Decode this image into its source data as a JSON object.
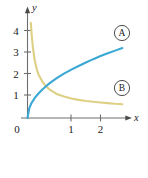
{
  "figure": {
    "background_color": "#ffffff",
    "axis_color": "#6e6e6e",
    "text_color": "#1a1a1a"
  },
  "axes": {
    "x_axis_label": "x",
    "y_axis_label": "y",
    "origin_label": "0",
    "x_ticks": [
      {
        "label": "1",
        "value": 1
      },
      {
        "label": "2",
        "value": 2
      }
    ],
    "y_ticks": [
      {
        "label": "1",
        "value": 1
      },
      {
        "label": "2",
        "value": 2
      },
      {
        "label": "3",
        "value": 3
      },
      {
        "label": "4",
        "value": 4
      }
    ]
  },
  "labels": {
    "curve_a_badge": "A",
    "curve_b_badge": "B"
  },
  "chart_data": {
    "type": "line",
    "title": "",
    "xlabel": "x",
    "ylabel": "y",
    "xlim": [
      0,
      2.75
    ],
    "ylim": [
      0,
      4.6
    ],
    "grid": false,
    "legend": "circled-badges-at-curve-ends",
    "xticks": [
      0,
      1,
      2
    ],
    "xticklabels": [
      "0",
      "1",
      "2"
    ],
    "yticks": [
      1,
      2,
      3,
      4
    ],
    "yticklabels": [
      "1",
      "2",
      "3",
      "4"
    ],
    "series": [
      {
        "name": "A",
        "color": "#3ba8d4",
        "description": "increasing concave-down curve through origin, rising to about 3.3 at x=2.6",
        "x": [
          0.0,
          0.05,
          0.1,
          0.2,
          0.3,
          0.4,
          0.5,
          0.6,
          0.8,
          1.0,
          1.2,
          1.4,
          1.6,
          1.8,
          2.0,
          2.2,
          2.4,
          2.6
        ],
        "y": [
          0.0,
          0.45,
          0.65,
          0.92,
          1.12,
          1.29,
          1.44,
          1.58,
          1.82,
          2.03,
          2.21,
          2.38,
          2.54,
          2.69,
          2.83,
          2.96,
          3.08,
          3.2
        ]
      },
      {
        "name": "B",
        "color": "#ddd084",
        "description": "decreasing convex curve, asymptotic to x-axis, descending from about 4.3 near x=0.1 to 0.6 at x=2.6",
        "x": [
          0.09,
          0.12,
          0.15,
          0.2,
          0.25,
          0.3,
          0.4,
          0.5,
          0.6,
          0.8,
          1.0,
          1.2,
          1.4,
          1.6,
          1.8,
          2.0,
          2.2,
          2.4,
          2.6
        ],
        "y": [
          4.35,
          3.7,
          3.2,
          2.62,
          2.25,
          2.0,
          1.68,
          1.46,
          1.31,
          1.1,
          0.98,
          0.89,
          0.83,
          0.78,
          0.74,
          0.71,
          0.68,
          0.65,
          0.63
        ]
      }
    ],
    "intersection": {
      "x": 0.55,
      "y": 1.37
    }
  }
}
